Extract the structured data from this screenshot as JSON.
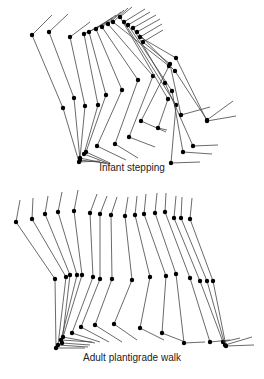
{
  "figure": {
    "panels": [
      {
        "id": "infant",
        "caption": "Infant stepping",
        "caption_y": 169,
        "line_color": "#444444",
        "joint_color": "#000000",
        "sticks": [
          [
            [
              52,
              15
            ],
            [
              32,
              35
            ],
            [
              63,
              108
            ],
            [
              79,
              162
            ],
            [
              100,
              161
            ]
          ],
          [
            [
              68,
              14
            ],
            [
              49,
              32
            ],
            [
              74,
              98
            ],
            [
              80,
              160
            ],
            [
              106,
              163
            ]
          ],
          [
            [
              90,
              22
            ],
            [
              70,
              37
            ],
            [
              85,
              106
            ],
            [
              80,
              158
            ],
            [
              108,
              164
            ]
          ],
          [
            [
              108,
              22
            ],
            [
              84,
              34
            ],
            [
              98,
              105
            ],
            [
              84,
              154
            ],
            [
              110,
              164
            ]
          ],
          [
            [
              112,
              18
            ],
            [
              89,
              32
            ],
            [
              106,
              95
            ],
            [
              86,
              152
            ],
            [
              110,
              163
            ]
          ],
          [
            [
              116,
              15
            ],
            [
              96,
              29
            ],
            [
              122,
              90
            ],
            [
              97,
              146
            ],
            [
              126,
              160
            ]
          ],
          [
            [
              121,
              12
            ],
            [
              102,
              27
            ],
            [
              138,
              80
            ],
            [
              115,
              144
            ],
            [
              138,
              158
            ]
          ],
          [
            [
              124,
              10
            ],
            [
              108,
              24
            ],
            [
              153,
              76
            ],
            [
              129,
              137
            ],
            [
              155,
              147
            ]
          ],
          [
            [
              128,
              8
            ],
            [
              113,
              22
            ],
            [
              169,
              66
            ],
            [
              141,
              121
            ],
            [
              166,
              132
            ]
          ],
          [
            [
              132,
              7
            ],
            [
              120,
              17
            ],
            [
              168,
              99
            ],
            [
              158,
              128
            ],
            [
              167,
              130
            ]
          ],
          [
            [
              145,
              9
            ],
            [
              124,
              22
            ],
            [
              176,
              105
            ],
            [
              171,
              163
            ],
            [
              200,
              162
            ]
          ],
          [
            [
              150,
              12
            ],
            [
              128,
              25
            ],
            [
              172,
              91
            ],
            [
              183,
              152
            ],
            [
              212,
              154
            ]
          ],
          [
            [
              156,
              15
            ],
            [
              133,
              28
            ],
            [
              165,
              83
            ],
            [
              193,
              146
            ],
            [
              218,
              145
            ]
          ],
          [
            [
              160,
              19
            ],
            [
              137,
              32
            ],
            [
              175,
              71
            ],
            [
              207,
              120
            ],
            [
              233,
              101
            ]
          ],
          [
            [
              162,
              24
            ],
            [
              140,
              37
            ],
            [
              176,
              58
            ],
            [
              207,
              121
            ],
            [
              236,
              116
            ]
          ],
          [
            [
              163,
              30
            ],
            [
              143,
              42
            ],
            [
              170,
              64
            ],
            [
              181,
              115
            ],
            [
              210,
              107
            ]
          ]
        ]
      },
      {
        "id": "adult",
        "caption": "Adult plantigrade walk",
        "caption_y": 359,
        "line_color": "#444444",
        "joint_color": "#000000",
        "sticks": [
          [
            [
              20,
              200
            ],
            [
              16,
              222
            ],
            [
              55,
              279
            ],
            [
              56,
              348
            ],
            [
              85,
              348
            ]
          ],
          [
            [
              33,
              198
            ],
            [
              32,
              219
            ],
            [
              66,
              277
            ],
            [
              58,
              345
            ],
            [
              88,
              347
            ]
          ],
          [
            [
              48,
              196
            ],
            [
              45,
              214
            ],
            [
              70,
              275
            ],
            [
              62,
              343
            ],
            [
              90,
              345
            ]
          ],
          [
            [
              62,
              192
            ],
            [
              58,
              212
            ],
            [
              77,
              275
            ],
            [
              61,
              340
            ],
            [
              92,
              342
            ]
          ],
          [
            [
              78,
              190
            ],
            [
              74,
              211
            ],
            [
              82,
              275
            ],
            [
              63,
              337
            ],
            [
              95,
              343
            ]
          ],
          [
            [
              97,
              194
            ],
            [
              90,
              213
            ],
            [
              93,
              277
            ],
            [
              72,
              333
            ],
            [
              100,
              342
            ]
          ],
          [
            [
              107,
              196
            ],
            [
              100,
              214
            ],
            [
              100,
              279
            ],
            [
              81,
              327
            ],
            [
              109,
              342
            ]
          ],
          [
            [
              117,
              197
            ],
            [
              111,
              215
            ],
            [
              112,
              279
            ],
            [
              95,
              325
            ],
            [
              122,
              342
            ]
          ],
          [
            [
              128,
              197
            ],
            [
              125,
              216
            ],
            [
              132,
              280
            ],
            [
              114,
              324
            ],
            [
              137,
              340
            ]
          ],
          [
            [
              137,
              196
            ],
            [
              135,
              215
            ],
            [
              150,
              277
            ],
            [
              140,
              328
            ],
            [
              164,
              340
            ]
          ],
          [
            [
              146,
              194
            ],
            [
              144,
              214
            ],
            [
              166,
              276
            ],
            [
              162,
              333
            ],
            [
              185,
              342
            ]
          ],
          [
            [
              157,
              193
            ],
            [
              155,
              213
            ],
            [
              176,
              274
            ],
            [
              184,
              343
            ],
            [
              205,
              342
            ]
          ],
          [
            [
              166,
              193
            ],
            [
              165,
              212
            ],
            [
              190,
              278
            ],
            [
              210,
              342
            ],
            [
              230,
              340
            ]
          ],
          [
            [
              176,
              196
            ],
            [
              174,
              218
            ],
            [
              200,
              281
            ],
            [
              223,
              342
            ],
            [
              240,
              338
            ]
          ],
          [
            [
              182,
              197
            ],
            [
              181,
              218
            ],
            [
              207,
              281
            ],
            [
              225,
              345
            ],
            [
              252,
              337
            ]
          ],
          [
            [
              192,
              198
            ],
            [
              190,
              219
            ],
            [
              213,
              281
            ],
            [
              226,
              346
            ],
            [
              254,
              345
            ]
          ]
        ]
      }
    ]
  }
}
